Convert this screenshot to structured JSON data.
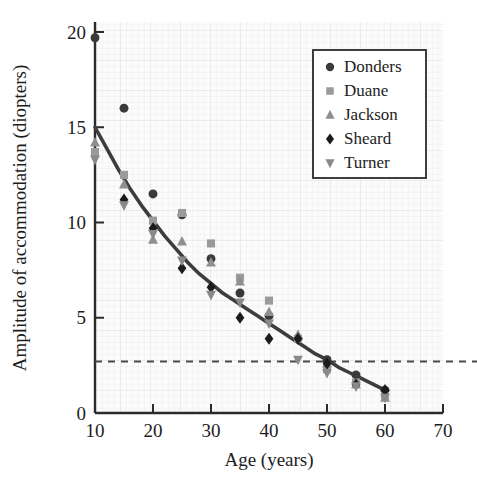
{
  "chart_data": {
    "type": "scatter",
    "title": "",
    "xlabel": "Age (years)",
    "ylabel": "Amplitude of accommodation (diopters)",
    "xlim": [
      10,
      70
    ],
    "ylim": [
      0,
      20
    ],
    "xticks": [
      10,
      20,
      30,
      40,
      50,
      60,
      70
    ],
    "yticks": [
      0,
      5,
      10,
      15,
      20
    ],
    "xticklabels": [
      "10",
      "20",
      "30",
      "40",
      "50",
      "60",
      "70"
    ],
    "yticklabels": [
      "0",
      "5",
      "10",
      "15",
      "20"
    ],
    "x_minor_tick_step": 5,
    "grid": "fine light background grid",
    "legend_position": "upper right",
    "legend_entries": [
      "Donders",
      "Duane",
      "Jackson",
      "Sheard",
      "Turner"
    ],
    "series": [
      {
        "name": "Donders",
        "marker": "circle",
        "color": "#3a3a3a",
        "x": [
          10,
          15,
          20,
          25,
          30,
          35,
          40,
          45,
          50,
          55,
          60
        ],
        "y": [
          19.7,
          16.0,
          11.5,
          10.4,
          8.1,
          6.3,
          5.1,
          3.9,
          2.8,
          2.0,
          1.2
        ]
      },
      {
        "name": "Duane",
        "marker": "square",
        "color": "#9a9a9a",
        "x": [
          10,
          15,
          20,
          25,
          30,
          35,
          40,
          45,
          50,
          55,
          60
        ],
        "y": [
          13.7,
          12.5,
          10.1,
          10.5,
          8.9,
          7.1,
          5.9,
          3.9,
          2.3,
          1.6,
          0.9
        ]
      },
      {
        "name": "Jackson",
        "marker": "triangle-up",
        "color": "#8f8f8f",
        "x": [
          10,
          15,
          20,
          25,
          30,
          35,
          40,
          45,
          50,
          55,
          60
        ],
        "y": [
          14.2,
          12.0,
          9.1,
          9.0,
          7.9,
          6.9,
          5.3,
          4.1,
          2.6,
          1.5,
          0.8
        ]
      },
      {
        "name": "Sheard",
        "marker": "diamond",
        "color": "#1c1c1c",
        "x": [
          15,
          20,
          25,
          30,
          35,
          40,
          45,
          50,
          55,
          60
        ],
        "y": [
          11.2,
          9.7,
          7.6,
          6.6,
          5.0,
          3.9,
          3.9,
          2.6,
          1.5,
          1.2
        ]
      },
      {
        "name": "Turner",
        "marker": "triangle-down",
        "color": "#8a8a8a",
        "x": [
          10,
          15,
          20,
          25,
          30,
          35,
          40,
          45,
          50,
          55,
          60
        ],
        "y": [
          13.3,
          10.9,
          9.4,
          8.0,
          6.2,
          5.8,
          4.7,
          2.8,
          2.1,
          1.4,
          0.8
        ]
      }
    ],
    "fit_curve": {
      "name": "fitted decline curve",
      "color": "#3d3d3d",
      "points": [
        [
          10,
          15.0
        ],
        [
          12,
          13.9
        ],
        [
          14,
          12.8
        ],
        [
          16,
          11.8
        ],
        [
          18,
          10.9
        ],
        [
          20,
          10.1
        ],
        [
          22,
          9.3
        ],
        [
          24,
          8.6
        ],
        [
          26,
          7.9
        ],
        [
          28,
          7.3
        ],
        [
          30,
          6.8
        ],
        [
          32,
          6.3
        ],
        [
          34,
          5.9
        ],
        [
          36,
          5.5
        ],
        [
          38,
          5.1
        ],
        [
          40,
          4.7
        ],
        [
          42,
          4.3
        ],
        [
          44,
          3.9
        ],
        [
          46,
          3.5
        ],
        [
          48,
          3.1
        ],
        [
          50,
          2.8
        ],
        [
          52,
          2.4
        ],
        [
          54,
          2.1
        ],
        [
          56,
          1.8
        ],
        [
          58,
          1.5
        ],
        [
          60,
          1.2
        ]
      ]
    },
    "reference_line": {
      "name": "presbyopia threshold",
      "orientation": "horizontal",
      "value": 2.7,
      "style": "dashed",
      "color": "#4a4a4a"
    }
  },
  "legend": {
    "items": [
      {
        "label": "Donders",
        "marker": "circle",
        "color": "#3a3a3a"
      },
      {
        "label": "Duane",
        "marker": "square",
        "color": "#9a9a9a"
      },
      {
        "label": "Jackson",
        "marker": "triangle-up",
        "color": "#8f8f8f"
      },
      {
        "label": "Sheard",
        "marker": "diamond",
        "color": "#1c1c1c"
      },
      {
        "label": "Turner",
        "marker": "triangle-down",
        "color": "#8a8a8a"
      }
    ]
  },
  "axes": {
    "x_title": "Age (years)",
    "y_title": "Amplitude of accommodation (diopters)",
    "x_tick_labels": [
      "10",
      "20",
      "30",
      "40",
      "50",
      "60",
      "70"
    ],
    "y_tick_labels": [
      "0",
      "5",
      "10",
      "15",
      "20"
    ]
  },
  "colors": {
    "background": "#ffffff",
    "plot_background": "#fafafa",
    "grid": "#e8e8e8",
    "axis": "#2b2b2b",
    "curve": "#3d3d3d",
    "dashed": "#4a4a4a"
  }
}
